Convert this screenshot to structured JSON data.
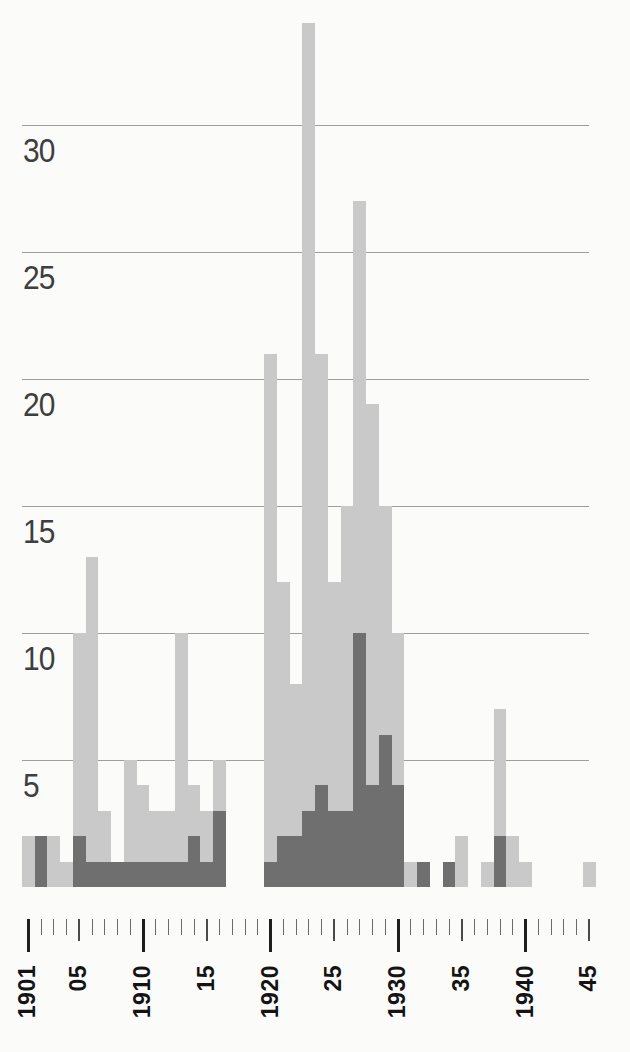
{
  "figure": {
    "background_color": "#fbfbfa",
    "bar_light_color": "#c9c9c9",
    "bar_dark_color": "#6f6f6f",
    "gridline_color": "#8d8d8d"
  },
  "y_axis": {
    "tick_labels": [
      "5",
      "10",
      "15",
      "20",
      "25",
      "30"
    ],
    "tick_values": [
      5,
      10,
      15,
      20,
      25,
      30
    ]
  },
  "x_axis": {
    "first_year": 1901,
    "last_year": 1945,
    "labels": [
      {
        "year": 1901,
        "text": "1901"
      },
      {
        "year": 1905,
        "text": "05"
      },
      {
        "year": 1910,
        "text": "1910"
      },
      {
        "year": 1915,
        "text": "15"
      },
      {
        "year": 1920,
        "text": "1920"
      },
      {
        "year": 1925,
        "text": "25"
      },
      {
        "year": 1930,
        "text": "1930"
      },
      {
        "year": 1935,
        "text": "35"
      },
      {
        "year": 1940,
        "text": "1940"
      },
      {
        "year": 1945,
        "text": "45"
      }
    ]
  },
  "chart_data": {
    "type": "bar",
    "title": "",
    "xlabel": "",
    "ylabel": "",
    "grid": "on",
    "legend": "none",
    "ylim": [
      0,
      35
    ],
    "gridlines": [
      5,
      10,
      15,
      20,
      25,
      30
    ],
    "x": [
      1901,
      1902,
      1903,
      1904,
      1905,
      1906,
      1907,
      1908,
      1909,
      1910,
      1911,
      1912,
      1913,
      1914,
      1915,
      1916,
      1917,
      1918,
      1919,
      1920,
      1921,
      1922,
      1923,
      1924,
      1925,
      1926,
      1927,
      1928,
      1929,
      1930,
      1931,
      1932,
      1933,
      1934,
      1935,
      1936,
      1937,
      1938,
      1939,
      1940,
      1941,
      1942,
      1943,
      1944,
      1945
    ],
    "series": [
      {
        "name": "light-gray-total",
        "color": "#c9c9c9",
        "values": [
          2,
          2,
          2,
          1,
          10,
          13,
          3,
          1,
          5,
          4,
          3,
          3,
          10,
          4,
          3,
          5,
          0,
          0,
          0,
          21,
          12,
          8,
          34,
          21,
          12,
          15,
          27,
          19,
          15,
          10,
          1,
          1,
          0,
          1,
          2,
          0,
          1,
          7,
          2,
          1,
          0,
          0,
          0,
          0,
          1
        ]
      },
      {
        "name": "dark-gray-subset",
        "color": "#6f6f6f",
        "values": [
          0,
          2,
          0,
          0,
          2,
          1,
          1,
          1,
          1,
          1,
          1,
          1,
          1,
          2,
          1,
          3,
          0,
          0,
          0,
          1,
          2,
          2,
          3,
          4,
          3,
          3,
          10,
          4,
          6,
          4,
          0,
          1,
          0,
          1,
          0,
          0,
          0,
          2,
          0,
          0,
          0,
          0,
          0,
          0,
          0
        ]
      }
    ]
  }
}
